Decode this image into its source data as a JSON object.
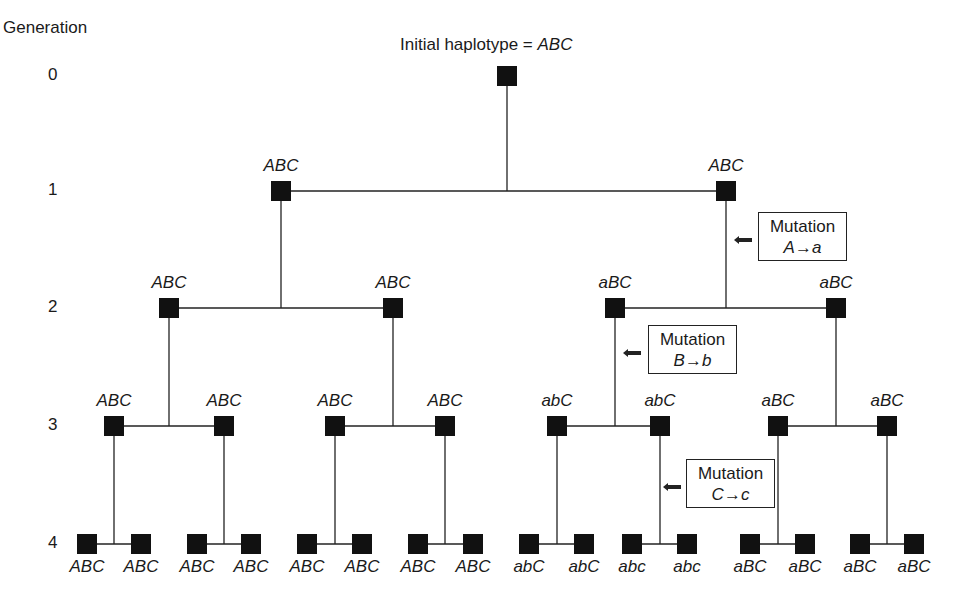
{
  "figure": {
    "generation_title": "Generation",
    "root_title_prefix": "Initial haplotype = ",
    "root_title_haplotype": "ABC",
    "generations": [
      {
        "label": "0",
        "y": 76
      },
      {
        "label": "1",
        "y": 191
      },
      {
        "label": "2",
        "y": 308
      },
      {
        "label": "3",
        "y": 426
      },
      {
        "label": "4",
        "y": 544
      }
    ],
    "nodes": {
      "g0": [
        {
          "x": 507,
          "haplotype": "ABC"
        }
      ],
      "g1": [
        {
          "x": 281,
          "haplotype": "ABC"
        },
        {
          "x": 726,
          "haplotype": "ABC"
        }
      ],
      "g2": [
        {
          "x": 169,
          "haplotype": "ABC"
        },
        {
          "x": 393,
          "haplotype": "ABC"
        },
        {
          "x": 615,
          "haplotype": "aBC"
        },
        {
          "x": 836,
          "haplotype": "aBC"
        }
      ],
      "g3": [
        {
          "x": 114,
          "haplotype": "ABC"
        },
        {
          "x": 224,
          "haplotype": "ABC"
        },
        {
          "x": 335,
          "haplotype": "ABC"
        },
        {
          "x": 445,
          "haplotype": "ABC"
        },
        {
          "x": 557,
          "haplotype": "abC"
        },
        {
          "x": 660,
          "haplotype": "abC"
        },
        {
          "x": 778,
          "haplotype": "aBC"
        },
        {
          "x": 887,
          "haplotype": "aBC"
        }
      ],
      "g4": [
        {
          "x": 87,
          "haplotype": "ABC"
        },
        {
          "x": 141,
          "haplotype": "ABC"
        },
        {
          "x": 197,
          "haplotype": "ABC"
        },
        {
          "x": 251,
          "haplotype": "ABC"
        },
        {
          "x": 307,
          "haplotype": "ABC"
        },
        {
          "x": 362,
          "haplotype": "ABC"
        },
        {
          "x": 418,
          "haplotype": "ABC"
        },
        {
          "x": 473,
          "haplotype": "ABC"
        },
        {
          "x": 529,
          "haplotype": "abC"
        },
        {
          "x": 584,
          "haplotype": "abC"
        },
        {
          "x": 632,
          "haplotype": "abc"
        },
        {
          "x": 687,
          "haplotype": "abc"
        },
        {
          "x": 750,
          "haplotype": "aBC"
        },
        {
          "x": 805,
          "haplotype": "aBC"
        },
        {
          "x": 860,
          "haplotype": "aBC"
        },
        {
          "x": 914,
          "haplotype": "aBC"
        }
      ]
    },
    "mutations": [
      {
        "title": "Mutation",
        "change": "A→a",
        "box": {
          "left": 758,
          "top": 212,
          "width": 87
        },
        "arrow": {
          "left": 738,
          "top": 238
        }
      },
      {
        "title": "Mutation",
        "change": "B→b",
        "box": {
          "left": 648,
          "top": 325,
          "width": 87
        },
        "arrow": {
          "left": 627,
          "top": 351
        }
      },
      {
        "title": "Mutation",
        "change": "C→c",
        "box": {
          "left": 686,
          "top": 459,
          "width": 87
        },
        "arrow": {
          "left": 667,
          "top": 485
        }
      }
    ]
  }
}
